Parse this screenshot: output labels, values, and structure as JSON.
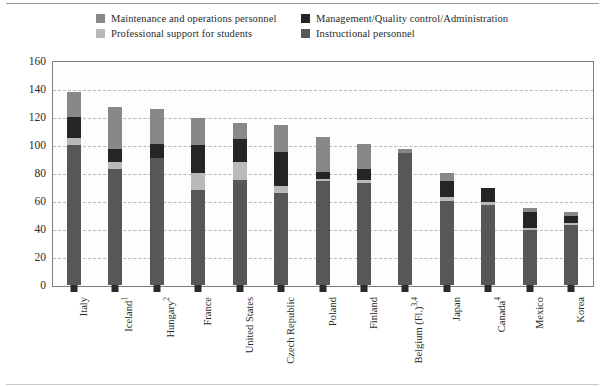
{
  "chart_data": {
    "type": "bar",
    "subtype": "stacked-vertical",
    "title": "",
    "xlabel": "",
    "ylabel": "",
    "ylim": [
      0,
      160
    ],
    "ytick_step": 20,
    "yticks": [
      160,
      140,
      120,
      100,
      80,
      60,
      40,
      20,
      0
    ],
    "grid": true,
    "grid_style": "dashed-horizontal",
    "legend_position": "top",
    "categories": [
      "Italy",
      "Iceland¹",
      "Hungary²",
      "France",
      "United States",
      "Czech Republic",
      "Poland",
      "Finland",
      "Belgium (Fl.)³,⁴",
      "Japan",
      "Canada⁴",
      "Mexico",
      "Korea"
    ],
    "series": [
      {
        "name": "Instructional personnel",
        "color": "#575757",
        "values": [
          100,
          83,
          91,
          68,
          75,
          66,
          74,
          73,
          94,
          60,
          57,
          39,
          43
        ]
      },
      {
        "name": "Professional support for students",
        "color": "#b9b9b9",
        "values": [
          5,
          5,
          0,
          12,
          13,
          5,
          2,
          2,
          0,
          3,
          2,
          2,
          1
        ]
      },
      {
        "name": "Management/Quality control/Administration",
        "color": "#252525",
        "values": [
          15,
          9,
          10,
          20,
          16,
          24,
          5,
          8,
          0,
          11,
          10,
          11,
          5
        ]
      },
      {
        "name": "Maintenance and operations personnel",
        "color": "#888888",
        "values": [
          18,
          30,
          25,
          19,
          12,
          19,
          25,
          18,
          3,
          6,
          0,
          3,
          3
        ]
      }
    ],
    "totals": [
      138,
      127,
      126,
      119,
      116,
      114,
      106,
      101,
      97,
      80,
      69,
      55,
      52
    ]
  },
  "legend": {
    "items": [
      {
        "label": "Maintenance and operations personnel",
        "color": "#888888",
        "swatch": "legend-swatch-maintenance"
      },
      {
        "label": "Management/Quality control/Administration",
        "color": "#252525",
        "swatch": "legend-swatch-management"
      },
      {
        "label": "Professional support for students",
        "color": "#b9b9b9",
        "swatch": "legend-swatch-support"
      },
      {
        "label": "Instructional personnel",
        "color": "#575757",
        "swatch": "legend-swatch-instructional"
      }
    ]
  },
  "axis": {
    "y_labels": [
      "160",
      "140",
      "120",
      "100",
      "80",
      "60",
      "40",
      "20",
      "0"
    ]
  }
}
